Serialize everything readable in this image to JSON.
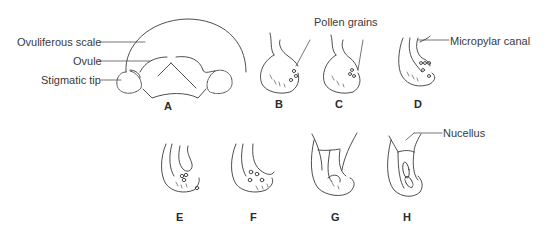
{
  "diagram": {
    "type": "botanical-illustration",
    "labels": {
      "ovuliferous_scale": "Ovuliferous scale",
      "ovule": "Ovule",
      "stigmatic_tip": "Stigmatic tip",
      "pollen_grains": "Pollen grains",
      "micropylar_canal": "Micropylar canal",
      "nucellus": "Nucellus"
    },
    "figures": [
      {
        "id": "A",
        "label": "A"
      },
      {
        "id": "B",
        "label": "B"
      },
      {
        "id": "C",
        "label": "C"
      },
      {
        "id": "D",
        "label": "D"
      },
      {
        "id": "E",
        "label": "E"
      },
      {
        "id": "F",
        "label": "F"
      },
      {
        "id": "G",
        "label": "G"
      },
      {
        "id": "H",
        "label": "H"
      }
    ],
    "colors": {
      "line": "#3a3a3a",
      "background": "#ffffff"
    }
  }
}
